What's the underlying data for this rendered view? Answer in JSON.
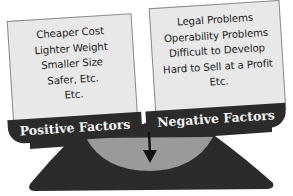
{
  "diagram": {
    "type": "balance-scale",
    "positive": {
      "label": "Positive Factors",
      "items": [
        "Cheaper Cost",
        "Lighter Weight",
        "Smaller Size",
        "Safer, Etc.",
        "Etc."
      ]
    },
    "negative": {
      "label": "Negative Factors",
      "items": [
        "Legal Problems",
        "Operability Problems",
        "Difficult to Develop",
        "Hard to Sell at a Profit",
        "Etc."
      ]
    },
    "pivot_arrow": "down-arrow-icon",
    "colors": {
      "box_fill": "#e8e8e8",
      "box_border": "#8a8a8a",
      "tab_fill": "#2b2b2b",
      "tab_text": "#f4f4f4",
      "base_fill": "#2b2b2b",
      "bowl_fill": "#9a9a9a",
      "arrow": "#111111"
    }
  }
}
